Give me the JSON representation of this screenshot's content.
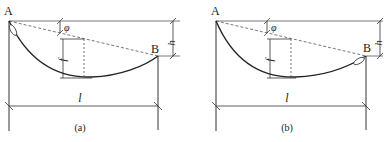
{
  "figure": {
    "panels": [
      {
        "id": "a",
        "caption": "(a)",
        "point_left": "A",
        "point_right": "B",
        "height_label": "h",
        "angle_label": "φ",
        "sag_label": "f",
        "span_label": "l",
        "anchor_end": "A"
      },
      {
        "id": "b",
        "caption": "(b)",
        "point_left": "A",
        "point_right": "B",
        "height_label": "h",
        "angle_label": "φ",
        "sag_label": "f",
        "span_label": "l",
        "anchor_end": "B"
      }
    ],
    "colors": {
      "line": "#333333",
      "curve": "#222222",
      "dashed": "#555555",
      "background": "#ffffff"
    }
  }
}
